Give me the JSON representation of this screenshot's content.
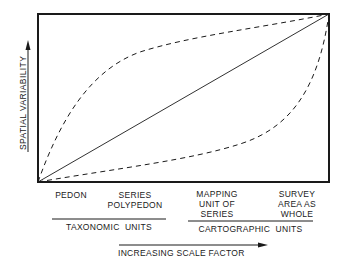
{
  "diagram": {
    "y_axis_label": "SPATIAL VARIABILITY",
    "x_axis_label": "INCREASING SCALE FACTOR",
    "categories": [
      {
        "label": "PEDON",
        "group": "taxonomic"
      },
      {
        "label": "SERIES\nPOLYPEDON",
        "group": "taxonomic"
      },
      {
        "label": "MAPPING\nUNIT OF\nSERIES",
        "group": "cartographic"
      },
      {
        "label": "SURVEY\nAREA AS\nWHOLE",
        "group": "cartographic"
      }
    ],
    "groups": {
      "taxonomic": "TAXONOMIC  UNITS",
      "cartographic": "CARTOGRAPHIC  UNITS"
    },
    "curves": [
      {
        "name": "upper-bound",
        "style": "dashed",
        "shape": "concave"
      },
      {
        "name": "mean",
        "style": "solid",
        "shape": "linear"
      },
      {
        "name": "lower-bound",
        "style": "dashed",
        "shape": "convex"
      }
    ],
    "colors": {
      "ink": "#1a1a1a",
      "background": "#ffffff"
    }
  }
}
